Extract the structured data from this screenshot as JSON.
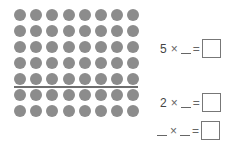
{
  "array": {
    "rows": 7,
    "columns": 8,
    "divider_after_row": 5,
    "dot_color": "#8c8c8c"
  },
  "equations": [
    {
      "first_factor": "5",
      "times": "×",
      "second_factor": "",
      "equals": "=",
      "answer": ""
    },
    {
      "first_factor": "2",
      "times": "×",
      "second_factor": "",
      "equals": "=",
      "answer": ""
    },
    {
      "first_factor": "",
      "times": "×",
      "second_factor": "",
      "equals": "=",
      "answer": ""
    }
  ]
}
